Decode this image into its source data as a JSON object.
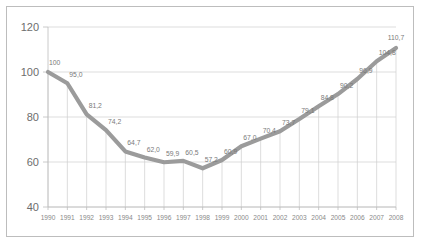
{
  "chart_data": {
    "type": "line",
    "title": "",
    "subtitle": "",
    "xlabel": "",
    "ylabel": "",
    "categories": [
      "1990",
      "1991",
      "1992",
      "1993",
      "1994",
      "1995",
      "1996",
      "1997",
      "1998",
      "1999",
      "2000",
      "2001",
      "2002",
      "2003",
      "2004",
      "2005",
      "2006",
      "2007",
      "2008"
    ],
    "values": [
      100,
      95.0,
      81.2,
      74.2,
      64.7,
      62.0,
      59.9,
      60.5,
      57.2,
      60.9,
      67.0,
      70.4,
      73.7,
      79.1,
      84.8,
      90.2,
      96.9,
      104.8,
      110.7
    ],
    "point_labels": [
      "100",
      "95,0",
      "81,2",
      "74,2",
      "64,7",
      "62,0",
      "59,9",
      "60,5",
      "57,2",
      "60,9",
      "67,0",
      "70,4",
      "73,7",
      "79,1",
      "84,8",
      "90,2",
      "96,9",
      "104,8",
      "110,7"
    ],
    "ylim": [
      40,
      120
    ],
    "yticks": [
      40,
      60,
      80,
      100,
      120
    ],
    "ytick_labels": [
      "40",
      "60",
      "80",
      "100",
      "120"
    ],
    "xlim_labels": [
      "1990",
      "2008"
    ],
    "grid": "horizontal-and-point-droplines",
    "legend": "none",
    "series": [
      {
        "name": "index",
        "values": [
          100,
          95.0,
          81.2,
          74.2,
          64.7,
          62.0,
          59.9,
          60.5,
          57.2,
          60.9,
          67.0,
          70.4,
          73.7,
          79.1,
          84.8,
          90.2,
          96.9,
          104.8,
          110.7
        ],
        "color": "#9b9b9b"
      }
    ],
    "colors": {
      "line": "#9b9b9b",
      "grid": "#cfcfcf",
      "axis": "#bdbdbd",
      "text": "#6d6d6d",
      "point_label_text": "#7a7a7a",
      "background": "#ffffff",
      "frame_border": "#bdbdbd"
    }
  }
}
